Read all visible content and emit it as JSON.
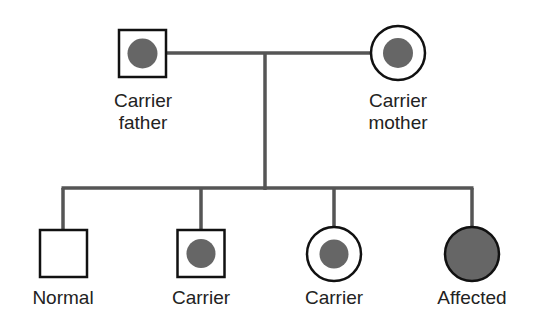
{
  "diagram": {
    "type": "pedigree",
    "colors": {
      "line": "#555555",
      "outline": "#111111",
      "fill": "#666666",
      "background": "#ffffff"
    },
    "parents": [
      {
        "id": "father",
        "shape": "square",
        "status": "carrier",
        "label_line1": "Carrier",
        "label_line2": "father"
      },
      {
        "id": "mother",
        "shape": "circle",
        "status": "carrier",
        "label_line1": "Carrier",
        "label_line2": "mother"
      }
    ],
    "children": [
      {
        "id": "child1",
        "shape": "square",
        "status": "normal",
        "label": "Normal"
      },
      {
        "id": "child2",
        "shape": "square",
        "status": "carrier",
        "label": "Carrier"
      },
      {
        "id": "child3",
        "shape": "circle",
        "status": "carrier",
        "label": "Carrier"
      },
      {
        "id": "child4",
        "shape": "circle",
        "status": "affected",
        "label": "Affected"
      }
    ]
  }
}
